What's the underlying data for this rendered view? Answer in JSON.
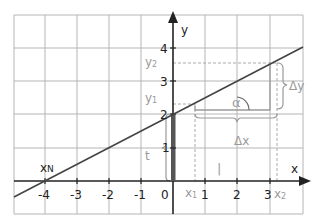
{
  "diagram": {
    "type": "linear-function-graph",
    "axes": {
      "x_label": "x",
      "y_label": "y",
      "x_ticks": [
        "-4",
        "-3",
        "-2",
        "-1",
        "0",
        "1",
        "2",
        "3"
      ],
      "y_ticks": [
        "1",
        "2",
        "3",
        "4"
      ]
    },
    "annotations": {
      "x_root": "x",
      "x_root_sub": "N",
      "x1": "x",
      "x1_sub": "1",
      "x2": "x",
      "x2_sub": "2",
      "y1": "y",
      "y1_sub": "1",
      "y2": "y",
      "y2_sub": "2",
      "intercept": "t",
      "angle": "α",
      "delta_x": "Δx",
      "delta_y": "Δy",
      "unit_segment": "|"
    },
    "line": {
      "slope": 0.5,
      "y_intercept": 2,
      "x_root": -4
    },
    "colors": {
      "grid": "#b5b5b5",
      "axis": "#222222",
      "line": "#444444",
      "annotation": "#9a9a9a",
      "intercept_bar": "#555555"
    }
  }
}
